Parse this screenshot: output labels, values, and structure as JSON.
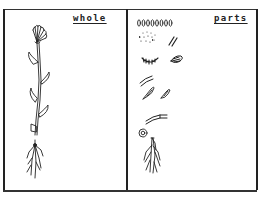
{
  "figure": {
    "type": "hand-drawn diagram",
    "panels": [
      {
        "id": "whole",
        "label": "whole",
        "content": "complete flowering plant with flower head, stem, alternate leaves and roots"
      },
      {
        "id": "parts",
        "label": "parts",
        "content": [
          "row of seeds",
          "scattered small seeds",
          "two short strokes (stamens/stems)",
          "flower base (calyx)",
          "petal cluster",
          "stem segments",
          "two leaves",
          "stem section",
          "flower center (round)",
          "root system"
        ]
      }
    ]
  },
  "colors": {
    "ink": "#222222",
    "paper": "#ffffff"
  }
}
